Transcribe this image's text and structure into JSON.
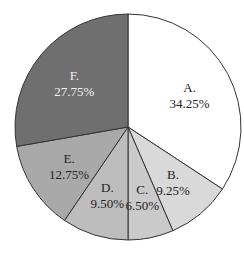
{
  "chart_data": {
    "type": "pie",
    "title": "",
    "categories": [
      "A.",
      "B.",
      "C.",
      "D.",
      "E.",
      "F."
    ],
    "values": [
      34.25,
      9.25,
      6.5,
      9.5,
      12.75,
      27.75
    ],
    "labels": [
      "34.25%",
      "9.25%",
      "6.50%",
      "9.50%",
      "12.75%",
      "27.75%"
    ],
    "colors": [
      "#ffffff",
      "#d9d9d9",
      "#cacaca",
      "#bdbdbd",
      "#a9a9a9",
      "#6f6f6f"
    ],
    "label_colors": [
      "#222222",
      "#222222",
      "#222222",
      "#222222",
      "#222222",
      "#f2f2f2"
    ],
    "start_angle_deg": 0,
    "direction": "clockwise",
    "legend": "none"
  },
  "geometry": {
    "cx": 128,
    "cy": 127,
    "r": 113
  }
}
